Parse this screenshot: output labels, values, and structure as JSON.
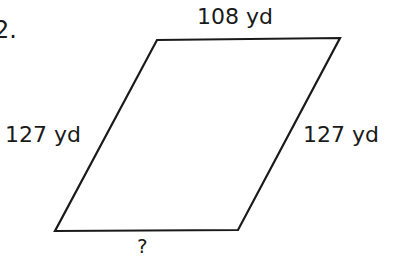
{
  "problem": {
    "number": "2."
  },
  "figure": {
    "shape": "parallelogram",
    "stroke_color": "#1a1a1a",
    "vertices": {
      "top_left": [
        157,
        40
      ],
      "top_right": [
        340,
        38
      ],
      "bottom_right": [
        238,
        230
      ],
      "bottom_left": [
        55,
        231
      ]
    },
    "sides": {
      "top": "108 yd",
      "left": "127 yd",
      "right": "127 yd",
      "bottom": "?"
    }
  }
}
